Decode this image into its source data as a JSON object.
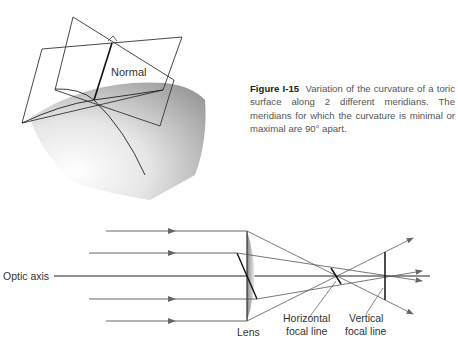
{
  "figure": {
    "id": "Figure I-15",
    "caption": "Variation of the curvature of a toric surface along 2 different meridians. The meridians for which the curvature is minimal or maximal are 90° apart."
  },
  "top_diagram": {
    "labels": {
      "normal": "Normal"
    }
  },
  "bottom_diagram": {
    "labels": {
      "optic_axis": "Optic axis",
      "lens": "Lens",
      "horizontal_focal_line_1": "Horizontal",
      "horizontal_focal_line_2": "focal line",
      "vertical_focal_line_1": "Vertical",
      "vertical_focal_line_2": "focal line"
    }
  }
}
